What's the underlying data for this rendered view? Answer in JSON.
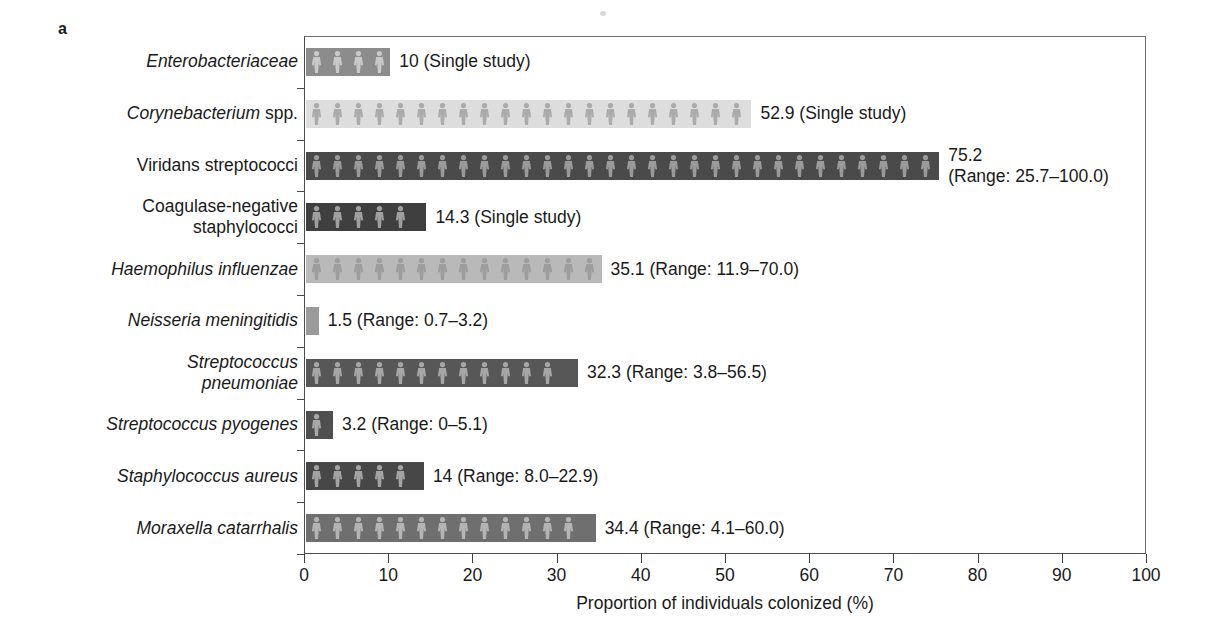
{
  "panel": {
    "letter": "a"
  },
  "chart_data": {
    "type": "bar",
    "orientation": "horizontal",
    "title": "",
    "xlabel": "Proportion of individuals colonized (%)",
    "ylabel": "",
    "xlim": [
      0,
      100
    ],
    "xticks": [
      0,
      10,
      20,
      30,
      40,
      50,
      60,
      70,
      80,
      90,
      100
    ],
    "xtick_labels": [
      "0",
      "10",
      "20",
      "30",
      "40",
      "50",
      "60",
      "70",
      "80",
      "90",
      "100"
    ],
    "grid": false,
    "legend": "none",
    "categories": [
      "Enterobacteriaceae",
      "Corynebacterium spp.",
      "Viridans streptococci",
      "Coagulase-negative staphylococci",
      "Haemophilus influenzae",
      "Neisseria meningitidis",
      "Streptococcus pneumoniae",
      "Streptococcus pyogenes",
      "Staphylococcus aureus",
      "Moraxella catarrhalis"
    ],
    "values": [
      10,
      52.9,
      75.2,
      14.3,
      35.1,
      1.5,
      32.3,
      3.2,
      14,
      34.4
    ]
  },
  "bars": [
    {
      "category": "Enterobacteriaceae",
      "label_style": "italic",
      "value": 10,
      "annotation": "10 (Single study)",
      "range_text": "Single study",
      "color": "#8c8c8c",
      "figure_color": "#c9c9c9"
    },
    {
      "category": "Corynebacterium spp.",
      "label_style": "mixed",
      "value": 52.9,
      "annotation": "52.9 (Single study)",
      "range_text": "Single study",
      "color": "#dddddd",
      "figure_color": "#ababab"
    },
    {
      "category": "Viridans streptococci",
      "label_style": "upright",
      "value": 75.2,
      "annotation": "75.2\n(Range: 25.7–100.0)",
      "range_text": "Range: 25.7–100.0",
      "color": "#4a4a4a",
      "figure_color": "#9a9a9a"
    },
    {
      "category": "Coagulase-negative\nstaphylococci",
      "label_style": "upright",
      "value": 14.3,
      "annotation": "14.3 (Single study)",
      "range_text": "Single study",
      "color": "#3f3f3f",
      "figure_color": "#9f9f9f"
    },
    {
      "category": "Haemophilus influenzae",
      "label_style": "italic",
      "value": 35.1,
      "annotation": "35.1 (Range: 11.9–70.0)",
      "range_text": "Range: 11.9–70.0",
      "color": "#b9b9b9",
      "figure_color": "#9d9d9d"
    },
    {
      "category": "Neisseria meningitidis",
      "label_style": "italic",
      "value": 1.5,
      "annotation": "1.5 (Range: 0.7–3.2)",
      "range_text": "Range: 0.7–3.2",
      "color": "#9a9a9a",
      "figure_color": "#bdbdbd"
    },
    {
      "category": "Streptococcus\npneumoniae",
      "label_style": "italic",
      "value": 32.3,
      "annotation": "32.3 (Range: 3.8–56.5)",
      "range_text": "Range: 3.8–56.5",
      "color": "#575757",
      "figure_color": "#a6a6a6"
    },
    {
      "category": "Streptococcus pyogenes",
      "label_style": "italic",
      "value": 3.2,
      "annotation": "3.2 (Range: 0–5.1)",
      "range_text": "Range: 0–5.1",
      "color": "#4f4f4f",
      "figure_color": "#a8a8a8"
    },
    {
      "category": "Staphylococcus aureus",
      "label_style": "italic",
      "value": 14,
      "annotation": "14 (Range: 8.0–22.9)",
      "range_text": "Range: 8.0–22.9",
      "color": "#474747",
      "figure_color": "#a3a3a3"
    },
    {
      "category": "Moraxella catarrhalis",
      "label_style": "italic",
      "value": 34.4,
      "annotation": "34.4  (Range: 4.1–60.0)",
      "range_text": "Range: 4.1–60.0",
      "color": "#6f6f6f",
      "figure_color": "#b4b4b4"
    }
  ],
  "icons": {
    "bar_fill": "person-figure-icon"
  }
}
